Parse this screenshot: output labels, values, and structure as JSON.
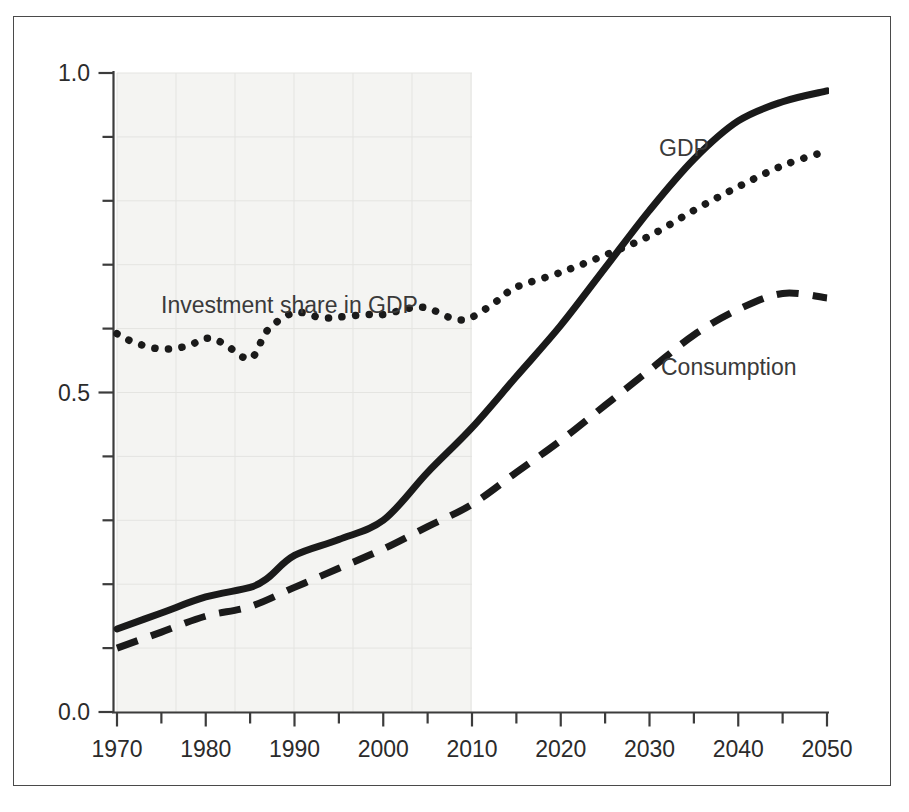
{
  "figure": {
    "title": "",
    "background_color": "#ffffff",
    "frame_color": "#4a4a4a",
    "shaded_region_color": "#f4f4f2",
    "ink_color": "#1a1a1a",
    "text_color": "#2b2b2b"
  },
  "axes": {
    "y_tick_labels": [
      "1.0",
      "0.5",
      "0.0"
    ],
    "x_tick_labels": [
      "1970",
      "1980",
      "1990",
      "2000",
      "2010",
      "2020",
      "2030",
      "2040",
      "2050"
    ]
  },
  "annotations": {
    "investment_label": "Investment share in GDP",
    "gdp_label": "GDP",
    "consumption_label": "Consumption"
  },
  "chart_data": {
    "type": "line",
    "title": "",
    "xlabel": "",
    "ylabel": "",
    "xlim": [
      1970,
      2050
    ],
    "ylim": [
      0.0,
      1.0
    ],
    "x_major_ticks": [
      1970,
      1980,
      1990,
      2000,
      2010,
      2020,
      2030,
      2040,
      2050
    ],
    "x_minor_tick_interval": 5,
    "y_major_ticks": [
      0.0,
      0.5,
      1.0
    ],
    "y_minor_tick_interval": 0.1,
    "grid": "faint-graph-paper-in-historical-region",
    "legend": "inline-annotations",
    "shaded_region": {
      "label": "historical",
      "x_start": 1970,
      "x_end": 2010
    },
    "series": [
      {
        "name": "GDP",
        "style": "solid",
        "x": [
          1970,
          1975,
          1980,
          1985,
          1987,
          1990,
          1995,
          2000,
          2005,
          2010,
          2015,
          2020,
          2025,
          2030,
          2035,
          2040,
          2045,
          2050
        ],
        "values": [
          0.13,
          0.155,
          0.18,
          0.195,
          0.21,
          0.245,
          0.27,
          0.3,
          0.375,
          0.445,
          0.525,
          0.605,
          0.695,
          0.785,
          0.865,
          0.925,
          0.955,
          0.972
        ]
      },
      {
        "name": "Consumption",
        "style": "dashed",
        "x": [
          1970,
          1975,
          1980,
          1985,
          1990,
          1995,
          2000,
          2005,
          2010,
          2015,
          2020,
          2025,
          2030,
          2035,
          2040,
          2045,
          2050
        ],
        "values": [
          0.1,
          0.125,
          0.15,
          0.165,
          0.195,
          0.225,
          0.255,
          0.29,
          0.325,
          0.375,
          0.425,
          0.48,
          0.535,
          0.59,
          0.63,
          0.655,
          0.648
        ]
      },
      {
        "name": "Investment share in GDP",
        "style": "dotted",
        "x": [
          1970,
          1972,
          1975,
          1978,
          1980,
          1982,
          1985,
          1987,
          1990,
          1993,
          1995,
          1998,
          2000,
          2003,
          2005,
          2008,
          2010,
          2013,
          2015,
          2020,
          2025,
          2030,
          2035,
          2040,
          2045,
          2050
        ],
        "values": [
          0.592,
          0.578,
          0.568,
          0.573,
          0.585,
          0.577,
          0.553,
          0.598,
          0.625,
          0.617,
          0.618,
          0.622,
          0.622,
          0.632,
          0.632,
          0.615,
          0.618,
          0.645,
          0.665,
          0.688,
          0.715,
          0.745,
          0.785,
          0.822,
          0.855,
          0.878
        ]
      }
    ]
  }
}
